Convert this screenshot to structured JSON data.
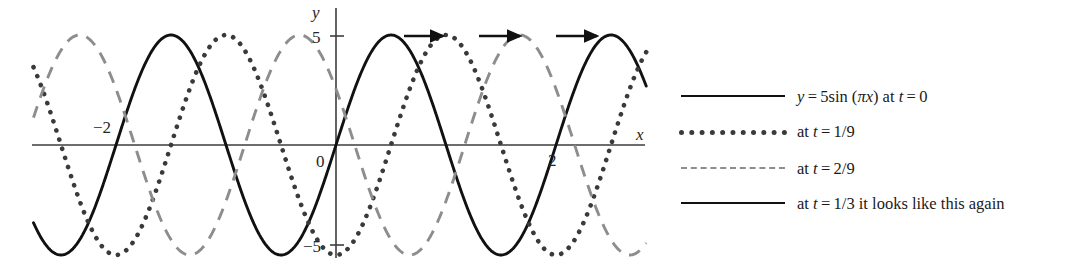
{
  "figure": {
    "axes": {
      "x_axis_label": "x",
      "y_axis_label": "y",
      "x_ticks": [
        {
          "value": -2,
          "label": "−2"
        },
        {
          "value": 2,
          "label": "2"
        }
      ],
      "y_ticks": [
        {
          "value": 5,
          "label": "5"
        },
        {
          "value": -5,
          "label": "−5"
        }
      ],
      "origin_label": "0",
      "xlim": [
        -2.75,
        2.82
      ],
      "ylim": [
        -5.9,
        5.9
      ]
    },
    "annotations": {
      "arrow_name": "rightward-motion-arrow",
      "arrow_count": 3,
      "arrow_direction": "right"
    }
  },
  "legend": {
    "position": "right",
    "entries": [
      {
        "style": "solid",
        "color": "#111111",
        "label": "y = 5sin (πx) at t = 0",
        "parts": [
          {
            "t": "y",
            "i": true
          },
          {
            "t": " = 5sin (",
            "i": false
          },
          {
            "t": "πx",
            "i": true
          },
          {
            "t": ") at ",
            "i": false
          },
          {
            "t": "t",
            "i": true
          },
          {
            "t": " = 0",
            "i": false
          }
        ]
      },
      {
        "style": "dotted",
        "color": "#3a3a3a",
        "label": "at t = 1/9",
        "parts": [
          {
            "t": "at ",
            "i": false
          },
          {
            "t": "t",
            "i": true
          },
          {
            "t": " = 1/9",
            "i": false
          }
        ]
      },
      {
        "style": "dashed",
        "color": "#8d8d8d",
        "label": "at t = 2/9",
        "parts": [
          {
            "t": "at ",
            "i": false
          },
          {
            "t": "t",
            "i": true
          },
          {
            "t": " = 2/9",
            "i": false
          }
        ]
      },
      {
        "style": "solid",
        "color": "#111111",
        "label": "at t = 1/3 it looks like this again",
        "parts": [
          {
            "t": "at ",
            "i": false
          },
          {
            "t": "t",
            "i": true
          },
          {
            "t": " = 1/3 it looks like this again",
            "i": false
          }
        ]
      }
    ]
  },
  "chart_data": {
    "type": "line",
    "title": "",
    "xlabel": "x",
    "ylabel": "y",
    "xlim": [
      -2.75,
      2.82
    ],
    "ylim": [
      -5.9,
      5.9
    ],
    "grid": false,
    "legend_position": "right",
    "amplitude": 5,
    "wavelength": 2,
    "function": "y = 5 sin(pi (x - shift))",
    "xticks": [
      -2,
      2
    ],
    "yticks": [
      -5,
      5
    ],
    "series": [
      {
        "name": "y = 5sin (πx) at t = 0",
        "style": "solid",
        "color": "#111111",
        "phase_shift": 0,
        "key_points": [
          {
            "x": -2.75,
            "y": -3.54
          },
          {
            "x": -2.5,
            "y": -5
          },
          {
            "x": -2,
            "y": 0
          },
          {
            "x": -1.5,
            "y": 5
          },
          {
            "x": -1,
            "y": 0
          },
          {
            "x": -0.5,
            "y": -5
          },
          {
            "x": 0,
            "y": 0
          },
          {
            "x": 0.5,
            "y": 5
          },
          {
            "x": 1,
            "y": 0
          },
          {
            "x": 1.5,
            "y": -5
          },
          {
            "x": 2,
            "y": 0
          },
          {
            "x": 2.5,
            "y": 5
          },
          {
            "x": 2.72,
            "y": 4.2
          }
        ]
      },
      {
        "name": "at t = 1/9",
        "style": "dotted",
        "color": "#3a3a3a",
        "phase_shift": 0.5,
        "key_points": [
          {
            "x": -2.75,
            "y": 3.54
          },
          {
            "x": -2,
            "y": -5
          },
          {
            "x": -1.5,
            "y": 0
          },
          {
            "x": -1,
            "y": 5
          },
          {
            "x": -0.5,
            "y": 0
          },
          {
            "x": 0,
            "y": -5
          },
          {
            "x": 0.5,
            "y": 0
          },
          {
            "x": 1,
            "y": 5
          },
          {
            "x": 1.5,
            "y": 0
          },
          {
            "x": 2,
            "y": -5
          },
          {
            "x": 2.5,
            "y": 0
          },
          {
            "x": 2.72,
            "y": 3.2
          }
        ]
      },
      {
        "name": "at t = 2/9",
        "style": "dashed",
        "color": "#8d8d8d",
        "phase_shift": 1.17,
        "key_points": [
          {
            "x": -2.75,
            "y": 1.4
          },
          {
            "x": -2.33,
            "y": 5
          },
          {
            "x": -1.83,
            "y": 0
          },
          {
            "x": -1.33,
            "y": -5
          },
          {
            "x": -0.83,
            "y": 0
          },
          {
            "x": -0.33,
            "y": 5
          },
          {
            "x": 0.17,
            "y": 0
          },
          {
            "x": 0.67,
            "y": -5
          },
          {
            "x": 1.17,
            "y": 0
          },
          {
            "x": 1.67,
            "y": 5
          },
          {
            "x": 2.17,
            "y": 0
          },
          {
            "x": 2.67,
            "y": -5
          },
          {
            "x": 2.72,
            "y": -4.9
          }
        ]
      }
    ]
  }
}
